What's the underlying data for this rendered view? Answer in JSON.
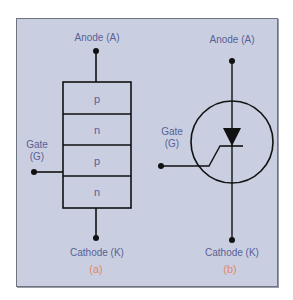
{
  "diagram": {
    "panel_a": {
      "anode_label": "Anode (A)",
      "gate_label_line1": "Gate",
      "gate_label_line2": "(G)",
      "cathode_label": "Cathode (K)",
      "caption": "(a)",
      "layers": [
        "p",
        "n",
        "p",
        "n"
      ]
    },
    "panel_b": {
      "anode_label": "Anode (A)",
      "gate_label_line1": "Gate",
      "gate_label_line2": "(G)",
      "cathode_label": "Cathode (K)",
      "caption": "(b)"
    },
    "colors": {
      "background": "#c9cfe1",
      "label_text": "#5a5f96",
      "caption_text": "#e08a66",
      "lines": "#111111"
    }
  }
}
